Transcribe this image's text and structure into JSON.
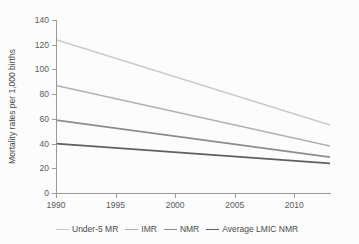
{
  "top_caption": "",
  "chart_data": {
    "type": "line",
    "title": "",
    "xlabel": "",
    "ylabel": "Mortality rates per 1,000 births",
    "xlim": [
      1990,
      2013
    ],
    "ylim": [
      0,
      140
    ],
    "xticks": [
      1990,
      1995,
      2000,
      2005,
      2010
    ],
    "yticks": [
      0,
      20,
      40,
      60,
      80,
      100,
      120,
      140
    ],
    "grid": false,
    "legend_position": "bottom",
    "x": [
      1990,
      2013
    ],
    "series": [
      {
        "name": "Under-5 MR",
        "color": "#c9c9c9",
        "width": 1.4,
        "values": [
          124,
          55
        ]
      },
      {
        "name": "IMR",
        "color": "#b0b0b0",
        "width": 1.4,
        "values": [
          87,
          38
        ]
      },
      {
        "name": "NMR",
        "color": "#8c8c8c",
        "width": 1.6,
        "values": [
          59,
          29
        ]
      },
      {
        "name": "Average LMIC NMR",
        "color": "#5f5f5f",
        "width": 1.8,
        "values": [
          40,
          24
        ]
      }
    ]
  }
}
